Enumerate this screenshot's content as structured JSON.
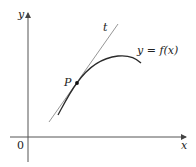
{
  "diagram": {
    "labels": {
      "y_axis": "y",
      "x_axis": "x",
      "origin": "0",
      "tangent": "t",
      "point": "P",
      "curve": "y = f(x)"
    },
    "colors": {
      "axis": "#555555",
      "curve": "#2a2a2a",
      "tangent": "#8a8a8a",
      "point": "#111111"
    }
  }
}
